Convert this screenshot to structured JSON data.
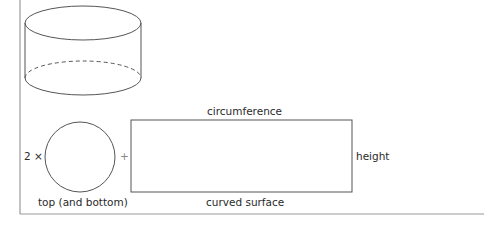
{
  "diagram": {
    "multiplier": "2 ×",
    "plus": "+",
    "labels": {
      "circle": "top (and bottom)",
      "rect_top": "circumference",
      "rect_right": "height",
      "rect_bottom": "curved surface"
    },
    "colors": {
      "stroke": "#555555",
      "frame": "#888888",
      "text": "#2a2a2a"
    }
  }
}
